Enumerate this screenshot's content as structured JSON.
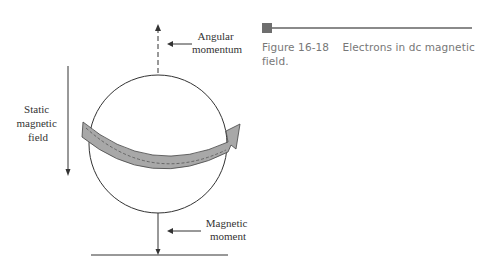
{
  "figure": {
    "number": "Figure 16-18",
    "caption": "Electrons in dc magnetic field.",
    "labels": {
      "angular_momentum": [
        "Angular",
        "momentum"
      ],
      "static_field": [
        "Static",
        "magnetic",
        "field"
      ],
      "magnetic_moment": [
        "Magnetic",
        "moment"
      ]
    },
    "colors": {
      "line": "#333333",
      "band_fill": "#a8a8a8",
      "caption_text": "#777777",
      "caption_rule": "#8a8a8a"
    }
  }
}
